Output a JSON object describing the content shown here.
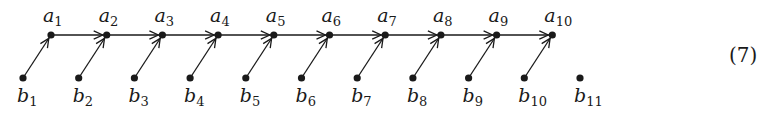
{
  "diagram": {
    "type": "directed-graph",
    "equation_number": "(7)",
    "top_nodes": [
      {
        "id": "a1",
        "base": "a",
        "sub": "1"
      },
      {
        "id": "a2",
        "base": "a",
        "sub": "2"
      },
      {
        "id": "a3",
        "base": "a",
        "sub": "3"
      },
      {
        "id": "a4",
        "base": "a",
        "sub": "4"
      },
      {
        "id": "a5",
        "base": "a",
        "sub": "5"
      },
      {
        "id": "a6",
        "base": "a",
        "sub": "6"
      },
      {
        "id": "a7",
        "base": "a",
        "sub": "7"
      },
      {
        "id": "a8",
        "base": "a",
        "sub": "8"
      },
      {
        "id": "a9",
        "base": "a",
        "sub": "9"
      },
      {
        "id": "a10",
        "base": "a",
        "sub": "10"
      }
    ],
    "bottom_nodes": [
      {
        "id": "b1",
        "base": "b",
        "sub": "1"
      },
      {
        "id": "b2",
        "base": "b",
        "sub": "2"
      },
      {
        "id": "b3",
        "base": "b",
        "sub": "3"
      },
      {
        "id": "b4",
        "base": "b",
        "sub": "4"
      },
      {
        "id": "b5",
        "base": "b",
        "sub": "5"
      },
      {
        "id": "b6",
        "base": "b",
        "sub": "6"
      },
      {
        "id": "b7",
        "base": "b",
        "sub": "7"
      },
      {
        "id": "b8",
        "base": "b",
        "sub": "8"
      },
      {
        "id": "b9",
        "base": "b",
        "sub": "9"
      },
      {
        "id": "b10",
        "base": "b",
        "sub": "10"
      },
      {
        "id": "b11",
        "base": "b",
        "sub": "11"
      }
    ],
    "edges": [
      {
        "from": "a1",
        "to": "a2"
      },
      {
        "from": "a2",
        "to": "a3"
      },
      {
        "from": "a3",
        "to": "a4"
      },
      {
        "from": "a4",
        "to": "a5"
      },
      {
        "from": "a5",
        "to": "a6"
      },
      {
        "from": "a6",
        "to": "a7"
      },
      {
        "from": "a7",
        "to": "a8"
      },
      {
        "from": "a8",
        "to": "a9"
      },
      {
        "from": "a9",
        "to": "a10"
      },
      {
        "from": "b1",
        "to": "a1"
      },
      {
        "from": "b2",
        "to": "a2"
      },
      {
        "from": "b3",
        "to": "a3"
      },
      {
        "from": "b4",
        "to": "a4"
      },
      {
        "from": "b5",
        "to": "a5"
      },
      {
        "from": "b6",
        "to": "a6"
      },
      {
        "from": "b7",
        "to": "a7"
      },
      {
        "from": "b8",
        "to": "a8"
      },
      {
        "from": "b9",
        "to": "a9"
      },
      {
        "from": "b10",
        "to": "a10"
      }
    ],
    "colors": {
      "ink": "#1a1a1a",
      "background": "#ffffff"
    }
  }
}
